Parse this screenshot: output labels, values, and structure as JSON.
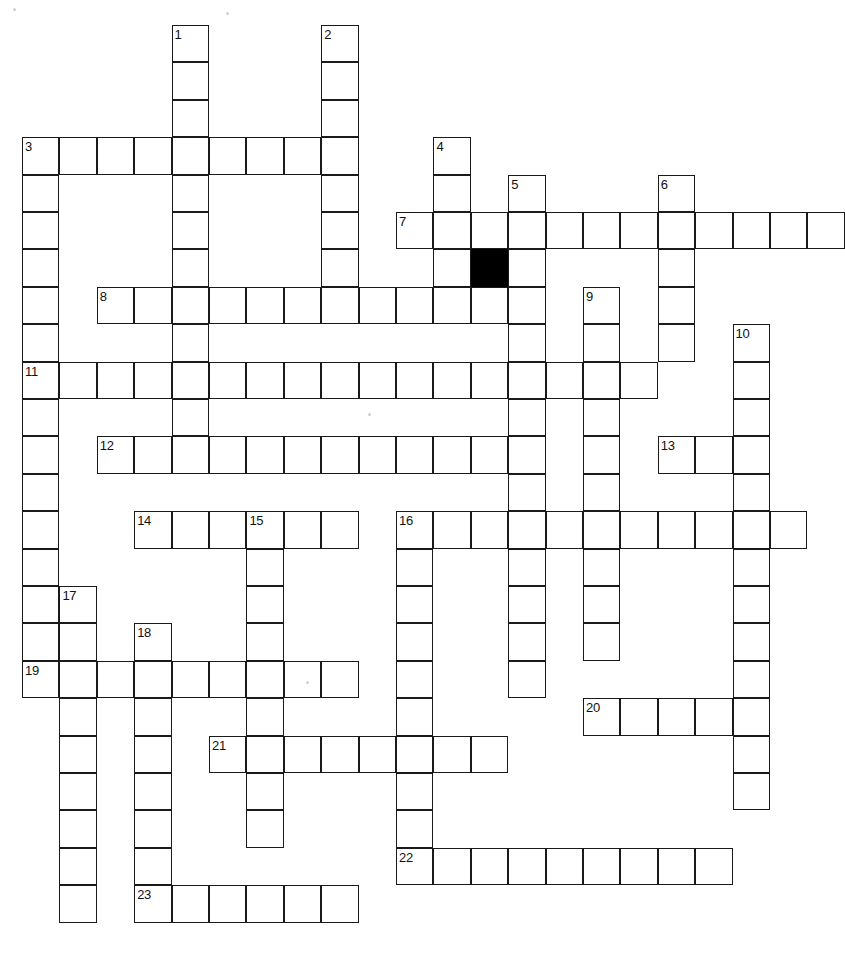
{
  "puzzle": {
    "title": "Crossword Puzzle Grid",
    "type": "crossword",
    "columns": 20,
    "rows": 25,
    "cell_size": 37.4,
    "origin_x": 22,
    "origin_y": 25,
    "colors": {
      "cell_fill": "#ffffff",
      "cell_border": "#1a1a1a",
      "block_fill": "#000000",
      "background": "#ffffff",
      "number_color": "#111111"
    },
    "entries": [
      {
        "number": "1",
        "direction": "down",
        "row": 0,
        "col": 4,
        "length": 12
      },
      {
        "number": "2",
        "direction": "down",
        "row": 0,
        "col": 8,
        "length": 7
      },
      {
        "number": "3",
        "direction": "across",
        "row": 3,
        "col": 0,
        "length": 9
      },
      {
        "number": "3",
        "direction": "down",
        "row": 3,
        "col": 0,
        "length": 15
      },
      {
        "number": "4",
        "direction": "down",
        "row": 3,
        "col": 11,
        "length": 5
      },
      {
        "number": "5",
        "direction": "down",
        "row": 4,
        "col": 13,
        "length": 14
      },
      {
        "number": "6",
        "direction": "down",
        "row": 4,
        "col": 17,
        "length": 5
      },
      {
        "number": "7",
        "direction": "across",
        "row": 5,
        "col": 10,
        "length": 12
      },
      {
        "number": "8",
        "direction": "across",
        "row": 7,
        "col": 2,
        "length": 12
      },
      {
        "number": "9",
        "direction": "down",
        "row": 7,
        "col": 15,
        "length": 10
      },
      {
        "number": "10",
        "direction": "down",
        "row": 8,
        "col": 19,
        "length": 13
      },
      {
        "number": "11",
        "direction": "across",
        "row": 9,
        "col": 0,
        "length": 17
      },
      {
        "number": "12",
        "direction": "across",
        "row": 11,
        "col": 2,
        "length": 12
      },
      {
        "number": "13",
        "direction": "across",
        "row": 11,
        "col": 17,
        "length": 3
      },
      {
        "number": "14",
        "direction": "across",
        "row": 13,
        "col": 3,
        "length": 6
      },
      {
        "number": "15",
        "direction": "down",
        "row": 13,
        "col": 6,
        "length": 9
      },
      {
        "number": "16",
        "direction": "across",
        "row": 13,
        "col": 10,
        "length": 11
      },
      {
        "number": "16",
        "direction": "down",
        "row": 13,
        "col": 10,
        "length": 10
      },
      {
        "number": "17",
        "direction": "down",
        "row": 15,
        "col": 1,
        "length": 9
      },
      {
        "number": "18",
        "direction": "down",
        "row": 16,
        "col": 3,
        "length": 8
      },
      {
        "number": "19",
        "direction": "across",
        "row": 17,
        "col": 0,
        "length": 9
      },
      {
        "number": "20",
        "direction": "across",
        "row": 18,
        "col": 15,
        "length": 5
      },
      {
        "number": "21",
        "direction": "across",
        "row": 19,
        "col": 5,
        "length": 8
      },
      {
        "number": "22",
        "direction": "across",
        "row": 22,
        "col": 10,
        "length": 9
      },
      {
        "number": "23",
        "direction": "across",
        "row": 23,
        "col": 3,
        "length": 6
      }
    ],
    "numbered_cells": [
      {
        "label": "1",
        "row": 0,
        "col": 4
      },
      {
        "label": "2",
        "row": 0,
        "col": 8
      },
      {
        "label": "3",
        "row": 3,
        "col": 0
      },
      {
        "label": "4",
        "row": 3,
        "col": 11
      },
      {
        "label": "5",
        "row": 4,
        "col": 13
      },
      {
        "label": "6",
        "row": 4,
        "col": 17
      },
      {
        "label": "7",
        "row": 5,
        "col": 10
      },
      {
        "label": "8",
        "row": 7,
        "col": 2
      },
      {
        "label": "9",
        "row": 7,
        "col": 15
      },
      {
        "label": "10",
        "row": 8,
        "col": 19
      },
      {
        "label": "11",
        "row": 9,
        "col": 0
      },
      {
        "label": "12",
        "row": 11,
        "col": 2
      },
      {
        "label": "13",
        "row": 11,
        "col": 17
      },
      {
        "label": "14",
        "row": 13,
        "col": 3
      },
      {
        "label": "15",
        "row": 13,
        "col": 6
      },
      {
        "label": "16",
        "row": 13,
        "col": 10
      },
      {
        "label": "17",
        "row": 15,
        "col": 1
      },
      {
        "label": "18",
        "row": 16,
        "col": 3
      },
      {
        "label": "19",
        "row": 17,
        "col": 0
      },
      {
        "label": "20",
        "row": 18,
        "col": 15
      },
      {
        "label": "21",
        "row": 19,
        "col": 5
      },
      {
        "label": "22",
        "row": 22,
        "col": 10
      },
      {
        "label": "23",
        "row": 23,
        "col": 3
      }
    ],
    "blocked_cells": [
      {
        "row": 6,
        "col": 12
      }
    ],
    "specks": [
      {
        "x": 13,
        "y": 8,
        "size": 3
      },
      {
        "x": 226,
        "y": 12,
        "size": 3
      },
      {
        "x": 368,
        "y": 413,
        "size": 3
      },
      {
        "x": 306,
        "y": 681,
        "size": 3
      }
    ]
  }
}
